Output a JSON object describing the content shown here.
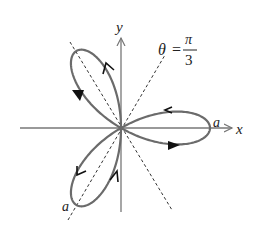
{
  "diagram": {
    "curve": "r = a cos(3θ)",
    "origin_px": [
      121,
      128
    ],
    "a_px": 89,
    "colors": {
      "curve": "#6b6b6b",
      "axes": "#777777",
      "dashed": "#333333",
      "arrows": "#111111"
    },
    "labels": {
      "x_axis": "x",
      "y_axis": "y",
      "a_right": "a",
      "a_lower": "a",
      "theta": "θ",
      "equals": "=",
      "pi": "π",
      "three": "3"
    },
    "dashed_lines": [
      {
        "name": "theta-pi-over-3-line",
        "angle_deg": 60
      },
      {
        "name": "theta-minus-pi-over-3-line",
        "angle_deg": -60
      }
    ]
  }
}
